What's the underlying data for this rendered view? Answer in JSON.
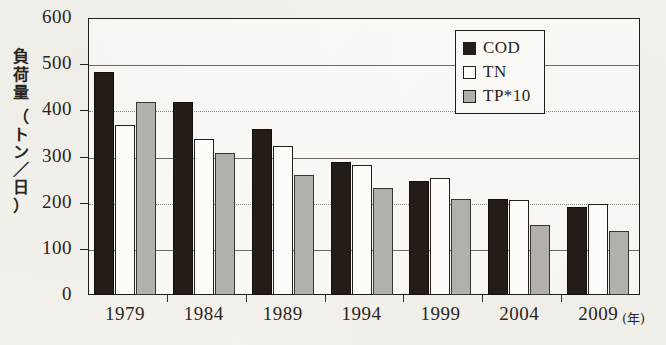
{
  "chart_data": {
    "type": "bar",
    "title": "",
    "xlabel": "年",
    "ylabel": "負荷量（トン／日）",
    "ylabel_chars": [
      "負",
      "荷",
      "量",
      "（",
      "ト",
      "ン",
      "／",
      "日",
      "）"
    ],
    "categories": [
      "1979",
      "1984",
      "1989",
      "1994",
      "1999",
      "2004",
      "2009"
    ],
    "series": [
      {
        "name": "COD",
        "values": [
          483,
          418,
          359,
          288,
          247,
          209,
          191
        ]
      },
      {
        "name": "TN",
        "values": [
          368,
          338,
          322,
          281,
          253,
          206,
          197
        ]
      },
      {
        "name": "TP*10",
        "values": [
          418,
          307,
          259,
          231,
          209,
          152,
          138
        ]
      }
    ],
    "ylim": [
      0,
      600
    ],
    "yticks": [
      0,
      100,
      200,
      300,
      400,
      500,
      600
    ],
    "ytick_labels": [
      "0",
      "100",
      "200",
      "300",
      "400",
      "500",
      "600"
    ],
    "grid": true,
    "legend_position": "top-right-inside"
  },
  "legend": {
    "items": [
      {
        "label": "COD",
        "color": "#241c16",
        "swatch": "cod"
      },
      {
        "label": "TN",
        "color": "#fdfcf8",
        "swatch": "tn"
      },
      {
        "label": "TP*10",
        "color": "#b3b0ab",
        "swatch": "tp"
      }
    ]
  },
  "axis": {
    "x_unit_label": "(年)"
  },
  "colors": {
    "background": "#f4f2ec",
    "plot_background": "#fbfaf6",
    "ink": "#231d19",
    "cod": "#241c16",
    "tn": "#fdfcf8",
    "tp": "#b3b0ab",
    "gridline": "#6f6a63"
  }
}
